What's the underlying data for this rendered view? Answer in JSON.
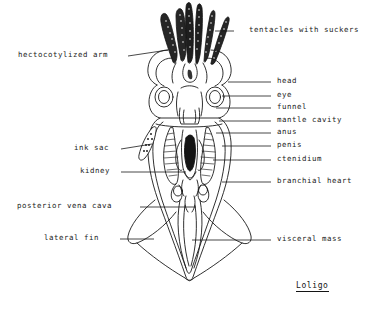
{
  "figure": {
    "organism": "Loligo",
    "caption": "Loligo",
    "view": "ventral dissection diagram",
    "background_color": "#ffffff",
    "ink_color": "#1a1a1a"
  },
  "labels_left": [
    {
      "id": "hectocotylized-arm",
      "text": "hectocotylized arm",
      "text_x": 18,
      "text_y": 55,
      "line_x1": 128,
      "line_y1": 56,
      "line_x2": 168,
      "line_y2": 50
    },
    {
      "id": "ink-sac",
      "text": "ink sac",
      "text_x": 74,
      "text_y": 148,
      "line_x1": 121,
      "line_y1": 149,
      "line_x2": 152,
      "line_y2": 144
    },
    {
      "id": "kidney",
      "text": "kidney",
      "text_x": 80,
      "text_y": 171,
      "line_x1": 121,
      "line_y1": 172,
      "line_x2": 186,
      "line_y2": 172
    },
    {
      "id": "posterior-vena-cava",
      "text": "posterior vena cava",
      "text_x": 17,
      "text_y": 206,
      "line_x1": 140,
      "line_y1": 207,
      "line_x2": 196,
      "line_y2": 207
    },
    {
      "id": "lateral-fin",
      "text": "lateral fin",
      "text_x": 44,
      "text_y": 238,
      "line_x1": 120,
      "line_y1": 239,
      "line_x2": 154,
      "line_y2": 239
    }
  ],
  "labels_right": [
    {
      "id": "tentacles-with-suckers",
      "text": "tentacles with suckers",
      "text_x": 249,
      "text_y": 30,
      "line_x1": 234,
      "line_y1": 31,
      "line_x2": 215,
      "line_y2": 31
    },
    {
      "id": "head",
      "text": "head",
      "text_x": 277,
      "text_y": 81,
      "line_x1": 271,
      "line_y1": 82,
      "line_x2": 228,
      "line_y2": 82
    },
    {
      "id": "eye",
      "text": "eye",
      "text_x": 277,
      "text_y": 95,
      "line_x1": 271,
      "line_y1": 96,
      "line_x2": 222,
      "line_y2": 96
    },
    {
      "id": "funnel",
      "text": "funnel",
      "text_x": 277,
      "text_y": 107,
      "line_x1": 271,
      "line_y1": 108,
      "line_x2": 216,
      "line_y2": 108
    },
    {
      "id": "mantle-cavity",
      "text": "mantle cavity",
      "text_x": 277,
      "text_y": 120,
      "line_x1": 271,
      "line_y1": 121,
      "line_x2": 219,
      "line_y2": 121
    },
    {
      "id": "anus",
      "text": "anus",
      "text_x": 277,
      "text_y": 132,
      "line_x1": 271,
      "line_y1": 133,
      "line_x2": 216,
      "line_y2": 133
    },
    {
      "id": "penis",
      "text": "penis",
      "text_x": 277,
      "text_y": 145,
      "line_x1": 271,
      "line_y1": 146,
      "line_x2": 222,
      "line_y2": 146
    },
    {
      "id": "ctenidium",
      "text": "ctenidium",
      "text_x": 277,
      "text_y": 159,
      "line_x1": 271,
      "line_y1": 160,
      "line_x2": 213,
      "line_y2": 160
    },
    {
      "id": "branchial-heart",
      "text": "branchial heart",
      "text_x": 277,
      "text_y": 181,
      "line_x1": 271,
      "line_y1": 182,
      "line_x2": 222,
      "line_y2": 182
    },
    {
      "id": "visceral-mass",
      "text": "visceral mass",
      "text_x": 277,
      "text_y": 239,
      "line_x1": 271,
      "line_y1": 240,
      "line_x2": 192,
      "line_y2": 240
    }
  ],
  "caption_pos": {
    "x": 296,
    "y": 281
  }
}
